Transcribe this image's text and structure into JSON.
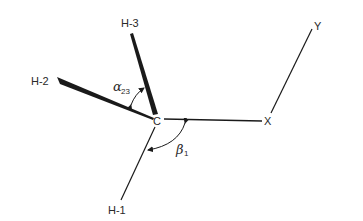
{
  "diagram": {
    "type": "molecular-geometry",
    "center_atom": "C",
    "atoms": {
      "h1": "H-1",
      "h2": "H-2",
      "h3": "H-3",
      "x": "X",
      "y": "Y"
    },
    "angles": {
      "alpha": {
        "symbol": "α",
        "subscript": "23"
      },
      "beta": {
        "symbol": "β",
        "subscript": "1"
      }
    },
    "colors": {
      "ink": "#1a1a1a",
      "background": "#ffffff"
    }
  }
}
